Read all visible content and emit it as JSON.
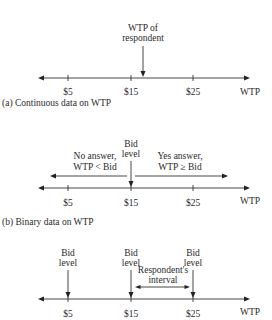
{
  "diagram": {
    "panels": [
      {
        "id": "a",
        "caption": "(a) Continuous data on WTP",
        "axis_label": "WTP",
        "ticks": [
          "$5",
          "$15",
          "$25"
        ],
        "marker_label_line1": "WTP of",
        "marker_label_line2": "respondent"
      },
      {
        "id": "b",
        "caption": "(b) Binary data on WTP",
        "axis_label": "WTP",
        "ticks": [
          "$5",
          "$15",
          "$25"
        ],
        "bid_label_line1": "Bid",
        "bid_label_line2": "level",
        "no_answer_line1": "No answer,",
        "no_answer_line2": "WTP < Bid",
        "yes_answer_line1": "Yes answer,",
        "yes_answer_line2": "WTP ≥ Bid"
      },
      {
        "id": "c",
        "axis_label": "WTP",
        "ticks": [
          "$5",
          "$15",
          "$25"
        ],
        "bids": [
          {
            "line1": "Bid",
            "line2": "level"
          },
          {
            "line1": "Bid",
            "line2": "level"
          },
          {
            "line1": "Bid",
            "line2": "level"
          }
        ],
        "interval_line1": "Respondent's",
        "interval_line2": "interval"
      }
    ]
  }
}
